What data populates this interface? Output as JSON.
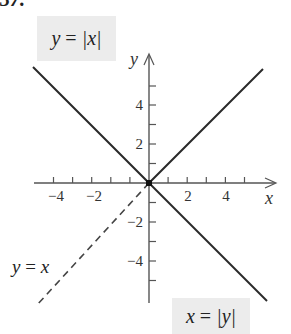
{
  "problem_label": "37.",
  "axes": {
    "x_label": "x",
    "y_label": "y",
    "x_ticks": [
      {
        "value": -4,
        "label": "−4"
      },
      {
        "value": -2,
        "label": "−2"
      },
      {
        "value": 2,
        "label": "2"
      },
      {
        "value": 4,
        "label": "4"
      }
    ],
    "y_ticks": [
      {
        "value": 4,
        "label": "4"
      },
      {
        "value": 2,
        "label": "2"
      },
      {
        "value": -2,
        "label": "−2"
      },
      {
        "value": -4,
        "label": "−4"
      }
    ],
    "x_range": [
      -6,
      6
    ],
    "y_range": [
      -6,
      6
    ]
  },
  "curves": [
    {
      "name": "y = |x|",
      "style": "solid",
      "description": "V shape opening upward"
    },
    {
      "name": "x = |y|",
      "style": "solid",
      "description": "V shape opening rightward"
    },
    {
      "name": "y = x",
      "style": "dashed",
      "description": "shown for x < 0"
    }
  ],
  "labels": {
    "y_abs_x": {
      "lhs": "y",
      "eq": " = ",
      "rhs": "|x|"
    },
    "x_abs_y": {
      "lhs": "x",
      "eq": " = ",
      "rhs": "|y|"
    },
    "y_eq_x": {
      "lhs": "y",
      "eq": " = ",
      "rhs": "x"
    }
  },
  "colors": {
    "line": "#2a2a2a",
    "axis": "#555555",
    "label_box": "#ececec"
  }
}
